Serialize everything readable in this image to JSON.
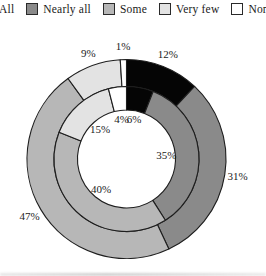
{
  "canvas": {
    "width": 266,
    "height": 276,
    "background": "#ffffff"
  },
  "legend": {
    "items": [
      {
        "label": "All",
        "color": "#050505"
      },
      {
        "label": "Nearly all",
        "color": "#8a8a8a"
      },
      {
        "label": "Some",
        "color": "#b7b7b7"
      },
      {
        "label": "Very few",
        "color": "#e3e3e3"
      },
      {
        "label": "None",
        "color": "#ffffff"
      }
    ]
  },
  "chart_data": {
    "type": "pie",
    "subtype": "nested-donut",
    "title": "",
    "categories": [
      "All",
      "Nearly all",
      "Some",
      "Very few",
      "None"
    ],
    "series": [
      {
        "name": "outer-ring",
        "values": [
          12,
          31,
          47,
          9,
          1
        ],
        "label_placement": "outside"
      },
      {
        "name": "inner-ring",
        "values": [
          6,
          35,
          40,
          15,
          4
        ],
        "label_placement": "inside"
      }
    ],
    "colors": [
      "#050505",
      "#8a8a8a",
      "#b7b7b7",
      "#e3e3e3",
      "#ffffff"
    ],
    "stroke_color": "#1e1e1e",
    "start_angle_deg": 0,
    "direction": "clockwise",
    "labels_format": "percent",
    "legend_position": "top"
  }
}
